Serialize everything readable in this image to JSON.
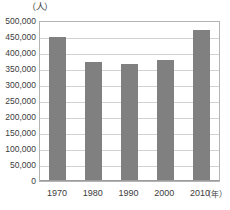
{
  "chart_data": {
    "type": "bar",
    "title": "",
    "subtitle": "",
    "xlabel": "（年）",
    "ylabel": "（人）",
    "categories": [
      "1970",
      "1980",
      "1990",
      "2000",
      "2010"
    ],
    "values": [
      451000,
      371000,
      365000,
      378000,
      473000
    ],
    "series": [
      {
        "name": "人口",
        "values": [
          451000,
          371000,
          365000,
          378000,
          473000
        ]
      }
    ],
    "ylim": [
      0,
      500000
    ],
    "ytick_step": 50000,
    "ytick_labels": [
      "500,000",
      "450,000",
      "400,000",
      "350,000",
      "300,000",
      "250,000",
      "200,000",
      "150,000",
      "100,000",
      "50,000",
      "0"
    ],
    "ytick_values": [
      500000,
      450000,
      400000,
      350000,
      300000,
      250000,
      200000,
      150000,
      100000,
      50000,
      0
    ],
    "xtick_labels": [
      "1970",
      "1980",
      "1990",
      "2000",
      "2010"
    ],
    "grid": true,
    "grid_axis": "y",
    "legend": false,
    "legend_position": "none",
    "bar_color": "#808080",
    "grid_color": "#d2d2d2",
    "axis_color": "#b4b4b4",
    "text_color": "#3c3c3c",
    "background": "#ffffff"
  }
}
